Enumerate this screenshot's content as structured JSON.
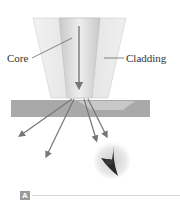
{
  "diagram": {
    "labels": {
      "core": "Core",
      "cladding": "Cladding"
    },
    "panel_label": "A",
    "colors": {
      "cladding": "#e6e6e6",
      "core": "#d4d4d4",
      "plate": "#a9a9a9",
      "arrow": "#777777",
      "leader": "#555555"
    }
  }
}
